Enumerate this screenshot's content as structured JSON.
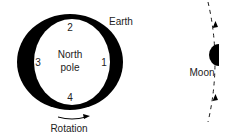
{
  "earth": {
    "label": "Earth",
    "center_label_line1": "North",
    "center_label_line2": "pole",
    "positions": [
      "1",
      "2",
      "3",
      "4"
    ]
  },
  "rotation": {
    "label": "Rotation"
  },
  "moon": {
    "label": "Moon"
  },
  "colors": {
    "ink": "#000000",
    "text": "#222222",
    "background": "#ffffff"
  }
}
